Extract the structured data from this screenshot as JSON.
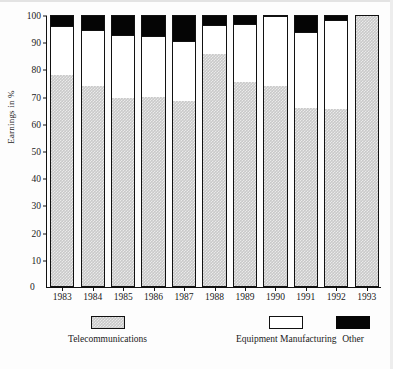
{
  "chart_data": {
    "type": "bar",
    "subtype": "stacked-bar-100-percent",
    "title": "",
    "xlabel": "",
    "ylabel": "Earnings in %",
    "ylim": [
      0,
      100
    ],
    "yticks": [
      0,
      10,
      20,
      30,
      40,
      50,
      60,
      70,
      80,
      90,
      100
    ],
    "ytick_labels": [
      "0",
      "10",
      "20",
      "30",
      "40",
      "50",
      "60",
      "70",
      "80",
      "90",
      "100"
    ],
    "grid": false,
    "legend_position": "bottom",
    "categories": [
      "1983",
      "1984",
      "1985",
      "1986",
      "1987",
      "1988",
      "1989",
      "1990",
      "1991",
      "1992",
      "1993"
    ],
    "series": [
      {
        "name": "Telecommunications",
        "color": "#c9c9c9",
        "pattern": "checkered-gray",
        "values": [
          78,
          74,
          69.5,
          70,
          68.5,
          86,
          75.5,
          74,
          66,
          65.5,
          100
        ]
      },
      {
        "name": "Equipment Manufacturing",
        "color": "#ffffff",
        "pattern": "solid-white",
        "values": [
          18.4,
          20.8,
          23.4,
          22.6,
          22.4,
          10.8,
          21.5,
          26,
          28.2,
          33,
          0
        ]
      },
      {
        "name": "Other",
        "color": "#050505",
        "pattern": "solid-black",
        "values": [
          3.6,
          5.2,
          7.1,
          7.4,
          9.1,
          3.2,
          3,
          0,
          5.8,
          1.5,
          0
        ]
      }
    ],
    "cumulative_tops": {
      "telecommunications": [
        78,
        74,
        69.5,
        70,
        68.5,
        86,
        75.5,
        74,
        66,
        65.5,
        100
      ],
      "equipment_manufacturing": [
        96.4,
        94.8,
        92.9,
        92.6,
        90.9,
        96.8,
        97,
        100,
        94.2,
        98.5,
        100
      ],
      "other": [
        100,
        100,
        100,
        100,
        100,
        100,
        100,
        100,
        100,
        100,
        100
      ]
    }
  },
  "axis": {
    "y_title": "Earnings in %",
    "zero_label": "0"
  },
  "legend": {
    "items": [
      {
        "label": "Telecommunications",
        "swatch": "gray-checkered-swatch"
      },
      {
        "label": "Equipment Manufacturing",
        "swatch": "white-swatch"
      },
      {
        "label": "Other",
        "swatch": "black-swatch"
      }
    ]
  }
}
